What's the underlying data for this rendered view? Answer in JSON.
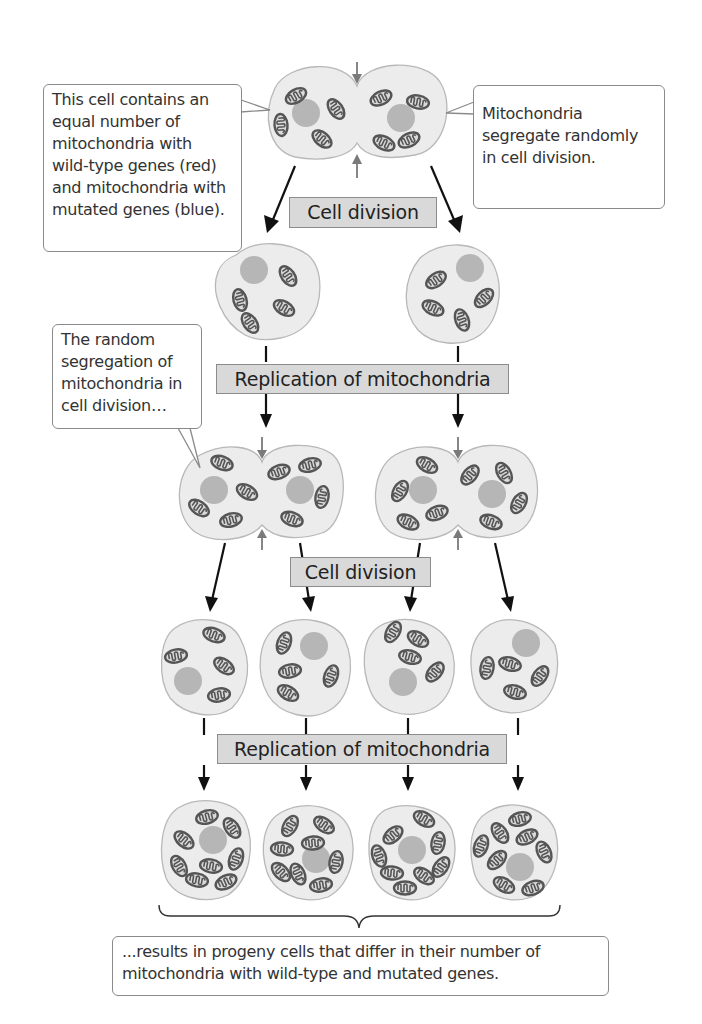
{
  "figure": {
    "title": "Random segregation of mitochondria in cell division",
    "callouts": {
      "top_left": "This cell contains an equal number of mitochondria with wild-type genes (red) and mitochondria with mutated genes (blue).",
      "top_right": "Mitochondria segregate randomly in cell division.",
      "middle_left": "The random segregation of mitochondria in cell division…",
      "bottom": "...results in progeny cells that differ in their number of mitochondria with wild-type and mutated genes."
    },
    "process_labels": {
      "step1": "Cell division",
      "step2": "Replication of mitochondria",
      "step3": "Cell division",
      "step4": "Replication of mitochondria"
    },
    "stages": [
      {
        "name": "parent-dividing-cell",
        "cells": 1,
        "mitochondria": 8
      },
      {
        "name": "daughter-cells",
        "cells": 2,
        "mitochondria_per_cell": [
          4,
          4
        ]
      },
      {
        "name": "dividing-daughter-cells",
        "cells": 2,
        "mitochondria_per_cell": [
          8,
          8
        ]
      },
      {
        "name": "granddaughter-cells",
        "cells": 4,
        "mitochondria_per_cell": [
          4,
          4,
          4,
          4
        ]
      },
      {
        "name": "progeny-cells",
        "cells": 4,
        "mitochondria_per_cell": [
          8,
          8,
          8,
          8
        ]
      }
    ],
    "colors": {
      "cell_fill": "#ececec",
      "cell_outline": "#b8b8b8",
      "nucleus": "#b6b6b6",
      "mitochondria_outline": "#555555",
      "label_box": "#d9d9d9",
      "arrow": "#111111",
      "division_arrow": "#7a7a7a"
    }
  }
}
